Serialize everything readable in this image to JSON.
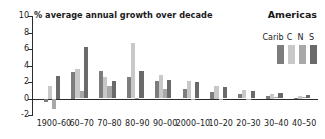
{
  "chart": {
    "title": "% average annual growth over decade",
    "region_title": "Americas"
  },
  "legend": {
    "entries": [
      {
        "label": "Carib",
        "color": "#7d7d7d"
      },
      {
        "label": "C",
        "color": "#c8c8c8"
      },
      {
        "label": "N",
        "color": "#a8a8a8"
      },
      {
        "label": "S",
        "color": "#6a6a6a"
      }
    ]
  },
  "chart_data": {
    "type": "bar",
    "title": "% average annual growth over decade",
    "subtitle": "Americas",
    "xlabel": "",
    "ylabel": "% average annual growth over decade",
    "ylim": [
      -2,
      10
    ],
    "yticks": [
      10,
      8,
      6,
      4,
      2,
      0,
      -2
    ],
    "grid": false,
    "legend_position": "top-right",
    "categories": [
      "1900–60",
      "60–70",
      "70–80",
      "80–90",
      "90–00",
      "2000–10",
      "10–20",
      "20–30",
      "30–40",
      "40–50"
    ],
    "series": [
      {
        "name": "Carib",
        "color": "#7d7d7d",
        "values": [
          -0.45,
          3.25,
          3.35,
          2.6,
          2.15,
          1.1,
          0.75,
          0.55,
          0.25,
          0.05
        ]
      },
      {
        "name": "C",
        "color": "#c8c8c8",
        "values": [
          1.5,
          3.55,
          2.6,
          6.7,
          2.85,
          2.15,
          1.5,
          1.05,
          0.5,
          0.25
        ]
      },
      {
        "name": "N",
        "color": "#a8a8a8",
        "values": [
          -1.3,
          0.85,
          1.55,
          0.1,
          1.2,
          -0.2,
          -0.15,
          -0.1,
          0.15,
          0.2
        ]
      },
      {
        "name": "S",
        "color": "#6a6a6a",
        "values": [
          2.75,
          6.3,
          2.1,
          3.35,
          2.2,
          1.95,
          1.4,
          0.95,
          0.7,
          0.4
        ]
      }
    ]
  }
}
